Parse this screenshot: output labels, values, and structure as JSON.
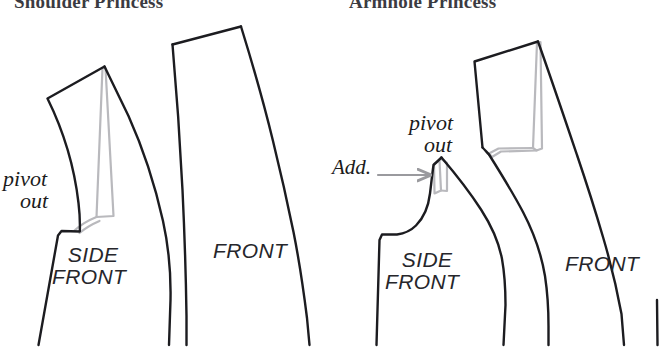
{
  "page": {
    "width": 667,
    "height": 352,
    "background": "#ffffff",
    "kind": "sewing-pattern-diagram"
  },
  "titles": {
    "left": "Shoulder Princess",
    "right": "Armhole Princess",
    "color": "#3b3b42"
  },
  "colors": {
    "outline": "#1c1c20",
    "pivot_ghost": "#b9b9bd",
    "arrow": "#9a9a9e",
    "label": "#1b1b1b",
    "background": "#ffffff"
  },
  "left_panel": {
    "name": "Shoulder Princess",
    "annotations": {
      "pivot_line1": "pivot",
      "pivot_line2": "out"
    },
    "pieces": [
      {
        "label_line1": "SIDE",
        "label_line2": "FRONT"
      },
      {
        "label_line1": "FRONT",
        "label_line2": ""
      }
    ]
  },
  "right_panel": {
    "name": "Armhole Princess",
    "annotations": {
      "pivot_line1": "pivot",
      "pivot_line2": "out",
      "add": "Add."
    },
    "pieces": [
      {
        "label_line1": "SIDE",
        "label_line2": "FRONT"
      },
      {
        "label_line1": "FRONT",
        "label_line2": ""
      }
    ]
  },
  "icons": {
    "add_arrow": "arrow-right-icon"
  }
}
